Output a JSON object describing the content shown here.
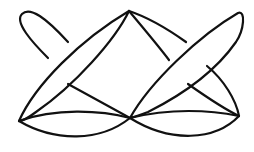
{
  "diagram": {
    "type": "line-drawing",
    "canvas": {
      "width": 254,
      "height": 152
    },
    "stroke_color": "#111111",
    "background_color": "#ffffff",
    "vertices": {
      "left": [
        19,
        121
      ],
      "top": [
        129,
        11
      ],
      "bottom_center": [
        130,
        118
      ],
      "right": [
        239,
        116
      ],
      "left_tip": [
        22,
        13
      ],
      "right_tip": [
        240,
        13
      ]
    },
    "paths": [
      {
        "id": "left-petal-upper",
        "d": "M19,121 C30,80 80,35 129,11"
      },
      {
        "id": "left-petal-lower",
        "d": "M129,11 C110,35 70,80 36,112"
      },
      {
        "id": "left-loop",
        "d": "M50,59 C35,40 15,20 24,13 C35,6 50,20 68,42"
      },
      {
        "id": "left-cross-line",
        "d": "M68,84 C90,98 110,108 130,118"
      },
      {
        "id": "left-arc-top",
        "d": "M19,121 C55,108 100,110 130,118"
      },
      {
        "id": "left-arc-bottom",
        "d": "M19,121 C55,140 100,140 130,118"
      },
      {
        "id": "top-to-center-right",
        "d": "M129,11 C150,20 175,32 186,42"
      },
      {
        "id": "top-to-mid",
        "d": "M129,11 C140,30 160,50 170,62"
      },
      {
        "id": "right-petal-upper",
        "d": "M130,118 C150,80 200,35 238,13 C244,12 243,30 236,42 C215,72 185,95 148,112"
      },
      {
        "id": "right-cross-line",
        "d": "M190,85 C210,98 225,108 239,116"
      },
      {
        "id": "right-side-curve",
        "d": "M208,66 C225,80 237,100 239,116"
      },
      {
        "id": "right-arc-top",
        "d": "M130,118 C170,108 210,110 239,116"
      },
      {
        "id": "right-arc-bottom",
        "d": "M130,118 C170,142 215,140 239,116"
      },
      {
        "id": "left-side-curve",
        "d": "M129,11 C128,50 127,90 130,118"
      }
    ]
  }
}
